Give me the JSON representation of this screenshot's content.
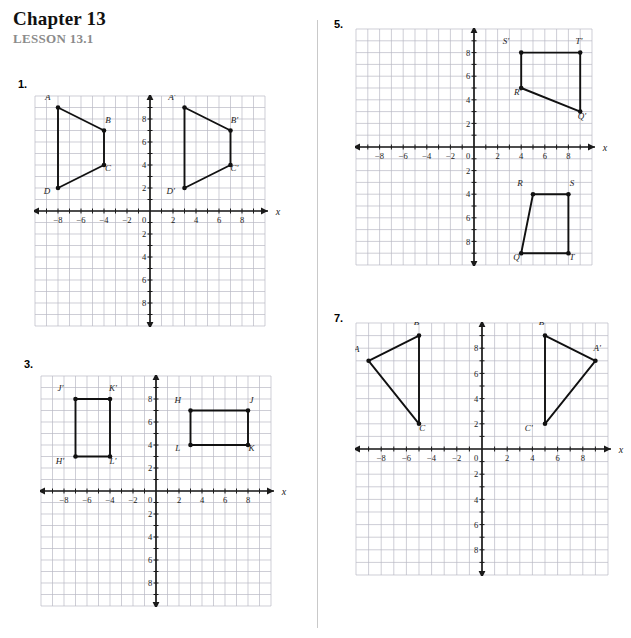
{
  "header": {
    "chapter": "Chapter 13",
    "lesson": "LESSON 13.1"
  },
  "axis": {
    "x_name": "x",
    "y_name": "y",
    "x_ticks": [
      "-8",
      "-6",
      "-4",
      "-2",
      "0",
      "2",
      "4",
      "6",
      "8"
    ],
    "y_ticks_up": [
      "2",
      "4",
      "6",
      "8"
    ],
    "y_ticks_down": [
      "2",
      "4",
      "6",
      "8"
    ],
    "origin_label": "0",
    "grid_color": "#b9b9c4",
    "axis_color": "#1a1a1a",
    "shape_color": "#111111"
  },
  "problems": [
    {
      "number": "1.",
      "chart_data": {
        "type": "scatter",
        "title": "",
        "xlabel": "x",
        "ylabel": "y",
        "xlim": [
          -10,
          10
        ],
        "ylim": [
          -10,
          10
        ],
        "grid": true,
        "series": [
          {
            "name": "ABCD",
            "closed": true,
            "points": [
              {
                "label": "A",
                "x": -8,
                "y": 9,
                "lx": -0.9,
                "ly": 0.95
              },
              {
                "label": "B",
                "x": -4,
                "y": 7,
                "lx": 0.35,
                "ly": 0.95
              },
              {
                "label": "C",
                "x": -4,
                "y": 4,
                "lx": 0.35,
                "ly": -0.25
              },
              {
                "label": "D",
                "x": -8,
                "y": 2,
                "lx": -0.95,
                "ly": -0.25
              }
            ]
          },
          {
            "name": "A'B'C'D'",
            "closed": true,
            "points": [
              {
                "label": "A'",
                "x": 3,
                "y": 9,
                "lx": -1.1,
                "ly": 0.95
              },
              {
                "label": "B'",
                "x": 7,
                "y": 7,
                "lx": 0.35,
                "ly": 0.95
              },
              {
                "label": "C'",
                "x": 7,
                "y": 4,
                "lx": 0.35,
                "ly": -0.25
              },
              {
                "label": "D'",
                "x": 3,
                "y": 2,
                "lx": -1.2,
                "ly": -0.3
              }
            ]
          }
        ]
      }
    },
    {
      "number": "3.",
      "chart_data": {
        "type": "scatter",
        "title": "",
        "xlabel": "x",
        "ylabel": "y",
        "xlim": [
          -10,
          10
        ],
        "ylim": [
          -10,
          10
        ],
        "grid": true,
        "series": [
          {
            "name": "J'K'L'H'",
            "closed": true,
            "points": [
              {
                "label": "J'",
                "x": -7,
                "y": 8,
                "lx": -1.3,
                "ly": 0.95
              },
              {
                "label": "K'",
                "x": -4,
                "y": 8,
                "lx": 0.25,
                "ly": 0.95
              },
              {
                "label": "L'",
                "x": -4,
                "y": 3,
                "lx": 0.25,
                "ly": -0.35
              },
              {
                "label": "H'",
                "x": -7,
                "y": 3,
                "lx": -1.35,
                "ly": -0.35
              }
            ]
          },
          {
            "name": "HJKL",
            "closed": true,
            "points": [
              {
                "label": "H",
                "x": 3,
                "y": 7,
                "lx": -1.1,
                "ly": 0.95
              },
              {
                "label": "J",
                "x": 8,
                "y": 7,
                "lx": 0.3,
                "ly": 0.95
              },
              {
                "label": "K",
                "x": 8,
                "y": 4,
                "lx": 0.3,
                "ly": -0.3
              },
              {
                "label": "L",
                "x": 3,
                "y": 4,
                "lx": -1.1,
                "ly": -0.3
              }
            ]
          }
        ]
      }
    },
    {
      "number": "5.",
      "chart_data": {
        "type": "scatter",
        "title": "",
        "xlabel": "x",
        "ylabel": "y",
        "xlim": [
          -10,
          10
        ],
        "ylim": [
          -10,
          10
        ],
        "grid": true,
        "series": [
          {
            "name": "S'T'Q'R'",
            "closed": true,
            "points": [
              {
                "label": "S'",
                "x": 4,
                "y": 8,
                "lx": -1.3,
                "ly": 0.95
              },
              {
                "label": "T'",
                "x": 9,
                "y": 8,
                "lx": -0.1,
                "ly": 1.0
              },
              {
                "label": "Q'",
                "x": 9,
                "y": 3,
                "lx": 0.15,
                "ly": -0.35
              },
              {
                "label": "R'",
                "x": 4,
                "y": 5,
                "lx": -0.3,
                "ly": -0.35
              }
            ]
          },
          {
            "name": "RSTQ",
            "closed": true,
            "points": [
              {
                "label": "R",
                "x": 5,
                "y": -4,
                "lx": -1.1,
                "ly": 0.95
              },
              {
                "label": "S",
                "x": 8,
                "y": -4,
                "lx": 0.3,
                "ly": 0.95
              },
              {
                "label": "T",
                "x": 8,
                "y": -9,
                "lx": 0.3,
                "ly": -0.35
              },
              {
                "label": "Q",
                "x": 4,
                "y": -9,
                "lx": -0.4,
                "ly": -0.35
              }
            ]
          }
        ]
      }
    },
    {
      "number": "7.",
      "chart_data": {
        "type": "scatter",
        "title": "",
        "xlabel": "x",
        "ylabel": "y",
        "xlim": [
          -10,
          10
        ],
        "ylim": [
          -10,
          10
        ],
        "grid": true,
        "series": [
          {
            "name": "ABC",
            "closed": true,
            "points": [
              {
                "label": "A",
                "x": -9,
                "y": 7,
                "lx": -0.95,
                "ly": 0.95
              },
              {
                "label": "B",
                "x": -5,
                "y": 9,
                "lx": -0.2,
                "ly": 1.1
              },
              {
                "label": "C",
                "x": -5,
                "y": 2,
                "lx": 0.25,
                "ly": -0.3
              }
            ]
          },
          {
            "name": "A'B'C'",
            "closed": true,
            "points": [
              {
                "label": "A'",
                "x": 9,
                "y": 7,
                "lx": 0.15,
                "ly": 1.0
              },
              {
                "label": "B'",
                "x": 5,
                "y": 9,
                "lx": -0.2,
                "ly": 1.1
              },
              {
                "label": "C'",
                "x": 5,
                "y": 2,
                "lx": -1.3,
                "ly": -0.3
              }
            ]
          }
        ]
      }
    }
  ]
}
